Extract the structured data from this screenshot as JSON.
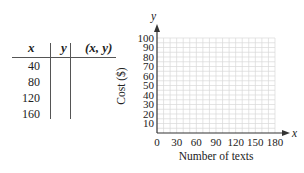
{
  "table": {
    "headers": [
      "x",
      "y",
      "(x, y)"
    ],
    "rows": [
      {
        "x": "40",
        "y": "",
        "xy": ""
      },
      {
        "x": "80",
        "y": "",
        "xy": ""
      },
      {
        "x": "120",
        "y": "",
        "xy": ""
      },
      {
        "x": "160",
        "y": "",
        "xy": ""
      }
    ]
  },
  "graph": {
    "x_axis_var": "x",
    "y_axis_var": "y",
    "x_label": "Number of texts",
    "y_label": "Cost ($)",
    "x_ticks": [
      "0",
      "30",
      "60",
      "90",
      "120",
      "150",
      "180"
    ],
    "y_ticks": [
      "10",
      "20",
      "30",
      "40",
      "50",
      "60",
      "70",
      "80",
      "90",
      "100"
    ]
  },
  "chart_data": {
    "type": "scatter",
    "title": "",
    "xlabel": "Number of texts",
    "ylabel": "Cost ($)",
    "xlim": [
      0,
      180
    ],
    "ylim": [
      0,
      100
    ],
    "x_ticks": [
      0,
      30,
      60,
      90,
      120,
      150,
      180
    ],
    "y_ticks": [
      10,
      20,
      30,
      40,
      50,
      60,
      70,
      80,
      90,
      100
    ],
    "grid": true,
    "series": [],
    "table": {
      "columns": [
        "x",
        "y",
        "(x, y)"
      ],
      "x_values": [
        40,
        80,
        120,
        160
      ]
    }
  }
}
